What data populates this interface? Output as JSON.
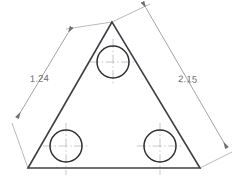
{
  "drawing": {
    "title": "Triangular plate with three holes",
    "type": "engineering-dimension-drawing",
    "background_color": "#ffffff",
    "outline_color": "#3f3f46",
    "dimension_color": "#9a9a9a",
    "centerline_color": "#b4b4b4",
    "text_color": "#6b6b6b",
    "outline": {
      "shape": "triangle",
      "vertices": [
        {
          "name": "apex",
          "x": 112,
          "y": 22
        },
        {
          "name": "bottom-left",
          "x": 28,
          "y": 168
        },
        {
          "name": "bottom-right",
          "x": 200,
          "y": 168
        }
      ]
    },
    "holes": [
      {
        "name": "top-hole",
        "cx": 113,
        "cy": 62,
        "r": 16
      },
      {
        "name": "bottom-left-hole",
        "cx": 66,
        "cy": 146,
        "r": 16
      },
      {
        "name": "bottom-right-hole",
        "cx": 160,
        "cy": 146,
        "r": 16
      }
    ],
    "dimensions": [
      {
        "id": "left-side",
        "label": "1.24",
        "label_x": 30,
        "label_y": 82,
        "line": {
          "x1": 68,
          "y1": 33,
          "x2": 17,
          "y2": 118
        },
        "ext1": {
          "x1": 112,
          "y1": 22,
          "x2": 66,
          "y2": 29
        },
        "ext2": {
          "x1": 28,
          "y1": 168,
          "x2": 12,
          "y2": 123
        },
        "arrows": [
          "start",
          "end"
        ]
      },
      {
        "id": "right-side",
        "label": "2.15",
        "label_x": 178,
        "label_y": 82,
        "line": {
          "x1": 146,
          "y1": 8,
          "x2": 227,
          "y2": 148
        },
        "ext1": {
          "x1": 112,
          "y1": 22,
          "x2": 150,
          "y2": 4
        },
        "ext2": {
          "x1": 200,
          "y1": 168,
          "x2": 232,
          "y2": 152
        },
        "arrows": [
          "start",
          "end"
        ]
      }
    ]
  }
}
